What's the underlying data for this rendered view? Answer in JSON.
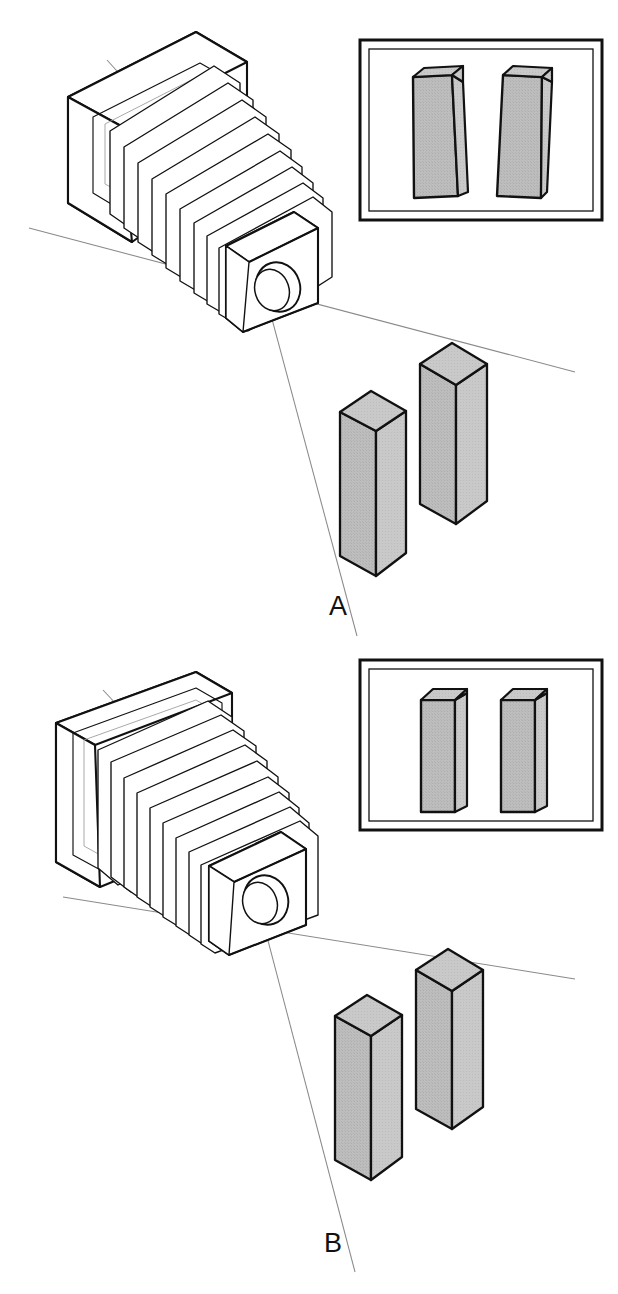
{
  "figure": {
    "background_color": "#ffffff",
    "line_color": "#111111",
    "ray_line_color": "#8a8a8a",
    "block_fill_color": "#b8b8b8",
    "block_edge_color": "#111111",
    "frame_color": "#111111",
    "width": 618,
    "height": 1294
  },
  "panels": [
    {
      "id": "A",
      "label": "A",
      "label_x": 338,
      "label_y": 615,
      "camera": {
        "name": "view-camera-tilted-back",
        "back_standard_state": "tilted",
        "bellows_folds": 9,
        "lens": "elliptical-lens-barrel"
      },
      "inset": {
        "name": "ground-glass-image-converging",
        "result": "converging verticals",
        "blocks_parallel": false
      },
      "subject_blocks": [
        {
          "name": "block-near-short",
          "height_class": "short"
        },
        {
          "name": "block-far-tall",
          "height_class": "tall"
        }
      ]
    },
    {
      "id": "B",
      "label": "B",
      "label_x": 333,
      "label_y": 1252,
      "camera": {
        "name": "view-camera-upright-back",
        "back_standard_state": "upright",
        "bellows_folds": 9,
        "lens": "elliptical-lens-barrel"
      },
      "inset": {
        "name": "ground-glass-image-parallel",
        "result": "parallel verticals",
        "blocks_parallel": true
      },
      "subject_blocks": [
        {
          "name": "block-near-short",
          "height_class": "short"
        },
        {
          "name": "block-far-tall",
          "height_class": "tall"
        }
      ]
    }
  ]
}
